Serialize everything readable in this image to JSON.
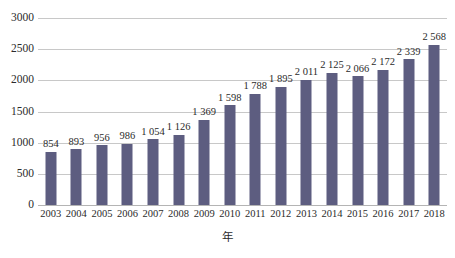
{
  "chart_data": {
    "type": "bar",
    "title": "",
    "subtitle": "",
    "xlabel": "年",
    "ylabel": "",
    "categories": [
      "2003",
      "2004",
      "2005",
      "2006",
      "2007",
      "2008",
      "2009",
      "2010",
      "2011",
      "2012",
      "2013",
      "2014",
      "2015",
      "2016",
      "2017",
      "2018"
    ],
    "values": [
      854,
      893,
      956,
      986,
      1054,
      1126,
      1369,
      1598,
      1788,
      1895,
      2011,
      2125,
      2066,
      2172,
      2339,
      2568
    ],
    "data_labels": [
      "854",
      "893",
      "956",
      "986",
      "1 054",
      "1 126",
      "1 369",
      "1 598",
      "1 788",
      "1 895",
      "2 011",
      "2 125",
      "2 066",
      "2 172",
      "2 339",
      "2 568"
    ],
    "ylim": [
      0,
      3000
    ],
    "y_ticks": [
      0,
      500,
      1000,
      1500,
      2000,
      2500,
      3000
    ],
    "y_tick_labels": [
      "0",
      "500",
      "1000",
      "1500",
      "2000",
      "2500",
      "3000"
    ],
    "grid": true,
    "grid_axis": "y",
    "legend": false,
    "legend_position": "none",
    "series": [
      {
        "name": "",
        "values": [
          854,
          893,
          956,
          986,
          1054,
          1126,
          1369,
          1598,
          1788,
          1895,
          2011,
          2125,
          2066,
          2172,
          2339,
          2568
        ],
        "color": "#5d5d80"
      }
    ],
    "colors": {
      "bar": "#5d5d80",
      "grid": "#c8c8c8",
      "axis": "#b4b4b4",
      "text": "#2b2b2b",
      "background": "#ffffff"
    }
  }
}
